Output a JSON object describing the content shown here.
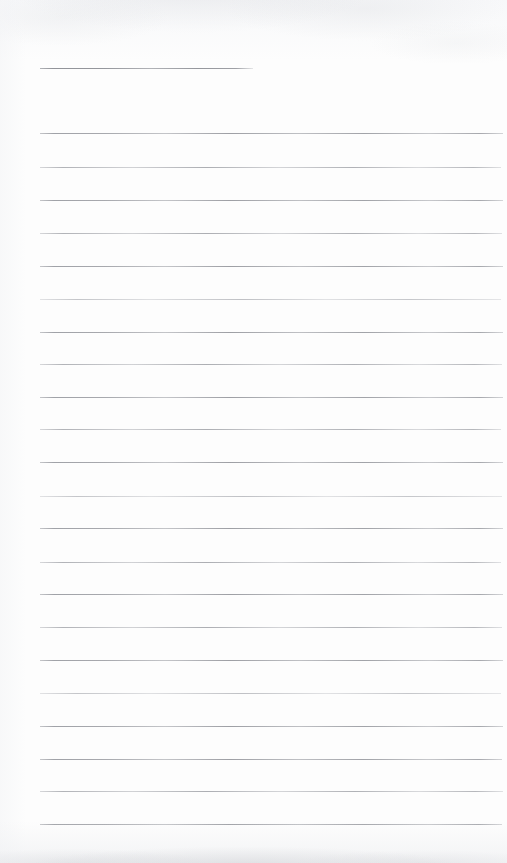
{
  "document": {
    "type": "scanned-lined-notepad-page",
    "title": "",
    "body_text": "",
    "page_width": 507,
    "page_height": 863,
    "paper_color": "#fdfdfd",
    "rule_color": "#9a9ca2",
    "is_blank": true
  },
  "ruling": {
    "left_margin_x": 40,
    "right_margin_x": 503,
    "line_spacing": 32.5,
    "line_thickness": 1,
    "title_line": {
      "label": "",
      "x_start": 40,
      "x_end": 253,
      "y": 68,
      "weight": "title-rule"
    },
    "lines": [
      {
        "y": 133,
        "x_start": 40,
        "x_end": 503,
        "weight": "rule",
        "text": ""
      },
      {
        "y": 167,
        "x_start": 40,
        "x_end": 501,
        "weight": "soft",
        "text": ""
      },
      {
        "y": 200,
        "x_start": 40,
        "x_end": 503,
        "weight": "rule",
        "text": ""
      },
      {
        "y": 233,
        "x_start": 40,
        "x_end": 502,
        "weight": "soft",
        "text": ""
      },
      {
        "y": 266,
        "x_start": 40,
        "x_end": 503,
        "weight": "rule",
        "text": ""
      },
      {
        "y": 299,
        "x_start": 40,
        "x_end": 501,
        "weight": "faint",
        "text": ""
      },
      {
        "y": 332,
        "x_start": 40,
        "x_end": 503,
        "weight": "rule",
        "text": ""
      },
      {
        "y": 364,
        "x_start": 40,
        "x_end": 502,
        "weight": "soft",
        "text": ""
      },
      {
        "y": 397,
        "x_start": 40,
        "x_end": 503,
        "weight": "rule",
        "text": ""
      },
      {
        "y": 429,
        "x_start": 40,
        "x_end": 501,
        "weight": "soft",
        "text": ""
      },
      {
        "y": 462,
        "x_start": 40,
        "x_end": 503,
        "weight": "rule",
        "text": ""
      },
      {
        "y": 496,
        "x_start": 40,
        "x_end": 502,
        "weight": "faint",
        "text": ""
      },
      {
        "y": 528,
        "x_start": 40,
        "x_end": 503,
        "weight": "rule",
        "text": ""
      },
      {
        "y": 562,
        "x_start": 40,
        "x_end": 501,
        "weight": "soft",
        "text": ""
      },
      {
        "y": 594,
        "x_start": 40,
        "x_end": 503,
        "weight": "rule",
        "text": ""
      },
      {
        "y": 627,
        "x_start": 40,
        "x_end": 502,
        "weight": "soft",
        "text": ""
      },
      {
        "y": 660,
        "x_start": 40,
        "x_end": 503,
        "weight": "rule",
        "text": ""
      },
      {
        "y": 693,
        "x_start": 40,
        "x_end": 501,
        "weight": "faint",
        "text": ""
      },
      {
        "y": 726,
        "x_start": 40,
        "x_end": 503,
        "weight": "rule",
        "text": ""
      },
      {
        "y": 759,
        "x_start": 40,
        "x_end": 502,
        "weight": "rule",
        "text": ""
      },
      {
        "y": 791,
        "x_start": 40,
        "x_end": 503,
        "weight": "soft",
        "text": ""
      },
      {
        "y": 824,
        "x_start": 40,
        "x_end": 502,
        "weight": "rule",
        "text": ""
      }
    ]
  }
}
